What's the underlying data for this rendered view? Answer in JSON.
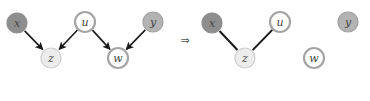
{
  "left_graph": {
    "nodes": [
      {
        "id": "x",
        "label": "x",
        "cx": 17,
        "cy": 23,
        "fill": "#8e8e8e",
        "stroke": "#8e8e8e",
        "type": "observed-dark"
      },
      {
        "id": "u",
        "label": "u",
        "cx": 85,
        "cy": 22,
        "fill": "#ffffff",
        "stroke": "#a5a5a5",
        "type": "latent"
      },
      {
        "id": "y",
        "label": "y",
        "cx": 153,
        "cy": 22,
        "fill": "#b3b3b3",
        "stroke": "#a0a0a0",
        "type": "observed-medium"
      },
      {
        "id": "z",
        "label": "z",
        "cx": 51,
        "cy": 58,
        "fill": "#ececec",
        "stroke": "#cfcfcf",
        "type": "observed-light"
      },
      {
        "id": "w",
        "label": "w",
        "cx": 118,
        "cy": 58,
        "fill": "#ffffff",
        "stroke": "#a5a5a5",
        "type": "latent"
      }
    ],
    "edges": [
      {
        "from": "x",
        "to": "z",
        "directed": true
      },
      {
        "from": "u",
        "to": "z",
        "directed": true
      },
      {
        "from": "u",
        "to": "w",
        "directed": true
      },
      {
        "from": "y",
        "to": "w",
        "directed": true
      }
    ]
  },
  "implies_symbol": "⇒",
  "right_graph": {
    "nodes": [
      {
        "id": "x",
        "label": "x",
        "cx": 212,
        "cy": 23,
        "fill": "#8e8e8e",
        "stroke": "#8e8e8e",
        "type": "observed-dark"
      },
      {
        "id": "u",
        "label": "u",
        "cx": 280,
        "cy": 22,
        "fill": "#ffffff",
        "stroke": "#a5a5a5",
        "type": "latent"
      },
      {
        "id": "y",
        "label": "y",
        "cx": 348,
        "cy": 22,
        "fill": "#b3b3b3",
        "stroke": "#a0a0a0",
        "type": "observed-medium"
      },
      {
        "id": "z",
        "label": "z",
        "cx": 245,
        "cy": 58,
        "fill": "#ececec",
        "stroke": "#cfcfcf",
        "type": "observed-light"
      },
      {
        "id": "w",
        "label": "w",
        "cx": 314,
        "cy": 58,
        "fill": "#ffffff",
        "stroke": "#a5a5a5",
        "type": "latent"
      }
    ],
    "edges": [
      {
        "from": "x",
        "to": "z",
        "directed": false
      },
      {
        "from": "u",
        "to": "z",
        "directed": false
      }
    ]
  },
  "colors": {
    "edge": "#1a1a1a",
    "label": "#444444",
    "background": "#ffffff"
  }
}
